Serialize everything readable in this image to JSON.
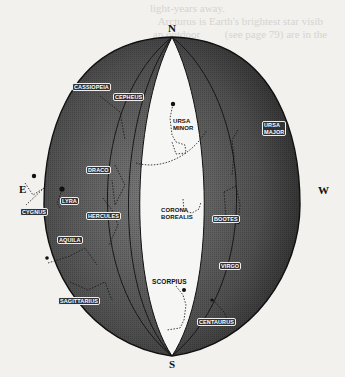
{
  "figure": {
    "colors": {
      "paper": "#f2f1ee",
      "sphere_dark": "#3a3a3a",
      "sphere_mid": "#6a6a6a",
      "gore_light": "#f6f6f4",
      "outline": "#111111"
    },
    "cardinals": {
      "north": "N",
      "south": "S",
      "east": "E",
      "west": "W"
    },
    "constellations": [
      {
        "id": "cassiopeia",
        "label": "Cassiopeia"
      },
      {
        "id": "cepheus",
        "label": "Cepheus"
      },
      {
        "id": "ursa-minor",
        "label": "Ursa\nMinor",
        "line1": "Ursa",
        "line2": "Minor"
      },
      {
        "id": "ursa-major",
        "label": "Ursa Major",
        "line1": "Ursa",
        "line2": "Major"
      },
      {
        "id": "draco",
        "label": "Draco"
      },
      {
        "id": "lyra",
        "label": "Lyra"
      },
      {
        "id": "cygnus",
        "label": "Cygnus"
      },
      {
        "id": "hercules",
        "label": "Hercules"
      },
      {
        "id": "corona-borealis",
        "label": "Corona Borealis",
        "line1": "Corona",
        "line2": "Borealis"
      },
      {
        "id": "bootes",
        "label": "Bootes"
      },
      {
        "id": "aquila",
        "label": "Aquila"
      },
      {
        "id": "virgo",
        "label": "Virgo"
      },
      {
        "id": "scorpius",
        "label": "Scorpius"
      },
      {
        "id": "sagittarius",
        "label": "Sagittarius"
      },
      {
        "id": "centaurus",
        "label": "Centaurus"
      }
    ]
  }
}
